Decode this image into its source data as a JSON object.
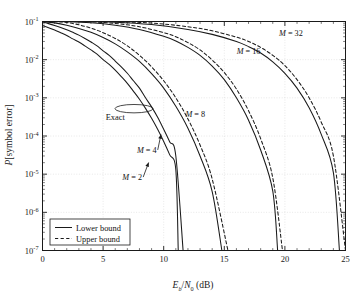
{
  "chart_data": {
    "type": "line",
    "title": "",
    "xlabel": "Eb/N0 (dB)",
    "xlabel_parts": {
      "lead": "E",
      "lead_sub": "b",
      "slash": "/",
      "second": "N",
      "second_sub": "0",
      "unit": " (dB)"
    },
    "ylabel": "P[symbol error]",
    "ylabel_parts": {
      "italic": "P",
      "rest": "[symbol error]"
    },
    "xlim": [
      0,
      25
    ],
    "ylim_exponents": [
      -7,
      -1
    ],
    "xticks": [
      "0",
      "5",
      "10",
      "15",
      "20",
      "25"
    ],
    "xtick_values": [
      0,
      5,
      10,
      15,
      20,
      25
    ],
    "yticks": [
      "10-1",
      "10-2",
      "10-3",
      "10-4",
      "10-5",
      "10-6",
      "10-7"
    ],
    "ytick_exponents": [
      "-1",
      "-2",
      "-3",
      "-4",
      "-5",
      "-6",
      "-7"
    ],
    "ytick_mantissa": "10",
    "grid": "major dotted, both axes",
    "legend_position": "lower left inside axes",
    "legend": [
      {
        "label": "Lower bound",
        "style": "solid"
      },
      {
        "label": "Upper bound",
        "style": "dashed"
      }
    ],
    "annotations": [
      {
        "text": "Exact",
        "x_dB": 6.0,
        "y": 0.00045,
        "marker": "ellipse around M=2 and M=4 curves"
      },
      {
        "text": "M = 2",
        "x_dB": 7.4,
        "y": 7e-06,
        "arrow_to_x_dB": 8.8,
        "arrow_to_y": 2.2e-05
      },
      {
        "text": "M = 4",
        "x_dB": 8.6,
        "y": 3.6e-05,
        "arrow_to_x_dB": 9.8,
        "arrow_to_y": 0.00012
      },
      {
        "text": "M = 8",
        "x_dB": 12.6,
        "y": 0.00031,
        "arrow_to_x_dB": null,
        "arrow_to_y": null
      },
      {
        "text": "M = 16",
        "x_dB": 17.0,
        "y": 0.014,
        "arrow_to_x_dB": null,
        "arrow_to_y": null
      },
      {
        "text": "M = 32",
        "x_dB": 20.5,
        "y": 0.042,
        "arrow_to_x_dB": null,
        "arrow_to_y": null
      }
    ],
    "series": [
      {
        "name": "M = 2 lower bound",
        "M": 2,
        "style": "solid",
        "points_x": [
          0,
          0.5,
          1,
          1.5,
          2,
          2.5,
          3,
          3.5,
          4,
          4.5,
          5,
          5.5,
          6,
          6.5,
          7,
          7.5,
          8,
          8.5,
          9,
          9.5,
          10,
          10.5,
          11,
          11.2
        ],
        "points_y": [
          0.078,
          0.069,
          0.06,
          0.051,
          0.043,
          0.035,
          0.029,
          0.023,
          0.018,
          0.014,
          0.01,
          0.0075,
          0.0053,
          0.0036,
          0.0024,
          0.0015,
          0.00092,
          0.00053,
          0.00029,
          0.00015,
          7.2e-05,
          3.2e-05,
          1.3e-05,
          1e-07
        ]
      },
      {
        "name": "M = 4 lower bound",
        "M": 4,
        "style": "solid",
        "points_x": [
          0,
          0.5,
          1,
          1.5,
          2,
          2.5,
          3,
          3.5,
          4,
          4.5,
          5,
          5.5,
          6,
          6.5,
          7,
          7.5,
          8,
          8.5,
          9,
          9.5,
          10,
          10.5,
          11,
          11.6
        ],
        "points_y": [
          0.097,
          0.088,
          0.079,
          0.07,
          0.061,
          0.052,
          0.044,
          0.036,
          0.029,
          0.023,
          0.017,
          0.013,
          0.0092,
          0.0065,
          0.0044,
          0.0028,
          0.0018,
          0.001,
          0.00058,
          0.00031,
          0.00015,
          7e-05,
          3e-05,
          1e-07
        ]
      },
      {
        "name": "M = 8 lower bound",
        "M": 8,
        "style": "solid",
        "points_x": [
          0,
          1,
          2,
          3,
          4,
          5,
          6,
          7,
          8,
          9,
          10,
          11,
          12,
          13,
          14,
          14.8
        ],
        "points_y": [
          0.099,
          0.092,
          0.08,
          0.066,
          0.052,
          0.038,
          0.026,
          0.016,
          0.009,
          0.0043,
          0.0018,
          0.0006,
          0.00016,
          3e-05,
          3.5e-06,
          1e-07
        ]
      },
      {
        "name": "M = 8 upper bound",
        "M": 8,
        "style": "dashed",
        "points_x": [
          0,
          1,
          2,
          3,
          4,
          5,
          6,
          7,
          8,
          9,
          10,
          11,
          12,
          13,
          14,
          15.3
        ],
        "points_y": [
          0.1,
          0.1,
          0.094,
          0.082,
          0.067,
          0.051,
          0.036,
          0.023,
          0.013,
          0.0065,
          0.0028,
          0.001,
          0.00028,
          5.8e-05,
          7.5e-06,
          1e-07
        ]
      },
      {
        "name": "M = 16 lower bound",
        "M": 16,
        "style": "solid",
        "points_x": [
          0,
          2,
          4,
          6,
          8,
          10,
          11,
          12,
          13,
          14,
          15,
          16,
          17,
          18,
          19,
          19.4
        ],
        "points_y": [
          0.1,
          0.099,
          0.093,
          0.08,
          0.062,
          0.041,
          0.031,
          0.021,
          0.013,
          0.0068,
          0.003,
          0.001,
          0.00026,
          4.3e-05,
          3.6e-06,
          1e-07
        ]
      },
      {
        "name": "M = 16 upper bound",
        "M": 16,
        "style": "dashed",
        "points_x": [
          0,
          2,
          4,
          6,
          8,
          10,
          11,
          12,
          13,
          14,
          15,
          16,
          17,
          18,
          19,
          19.8
        ],
        "points_y": [
          0.1,
          0.1,
          0.098,
          0.089,
          0.073,
          0.051,
          0.04,
          0.028,
          0.018,
          0.0098,
          0.0046,
          0.0017,
          0.00046,
          8.5e-05,
          8e-06,
          1e-07
        ]
      },
      {
        "name": "M = 32 lower bound",
        "M": 32,
        "style": "solid",
        "points_x": [
          0,
          3,
          6,
          9,
          12,
          14,
          16,
          17,
          18,
          19,
          20,
          21,
          22,
          23,
          24,
          24.5
        ],
        "points_y": [
          0.1,
          0.1,
          0.096,
          0.083,
          0.062,
          0.046,
          0.03,
          0.022,
          0.015,
          0.0088,
          0.0044,
          0.0018,
          0.00055,
          0.00011,
          1.1e-05,
          1e-07
        ]
      },
      {
        "name": "M = 32 upper bound",
        "M": 32,
        "style": "dashed",
        "points_x": [
          0,
          3,
          6,
          9,
          12,
          14,
          16,
          17,
          18,
          19,
          20,
          21,
          22,
          23,
          24,
          25
        ],
        "points_y": [
          0.1,
          0.1,
          0.099,
          0.091,
          0.073,
          0.057,
          0.039,
          0.03,
          0.021,
          0.013,
          0.007,
          0.003,
          0.001,
          0.00023,
          3e-05,
          1e-07
        ]
      }
    ],
    "colors": {
      "line": "#1a1a1a",
      "axis": "#1a1a1a",
      "grid": "#d8d8d8",
      "background": "#ffffff"
    }
  }
}
